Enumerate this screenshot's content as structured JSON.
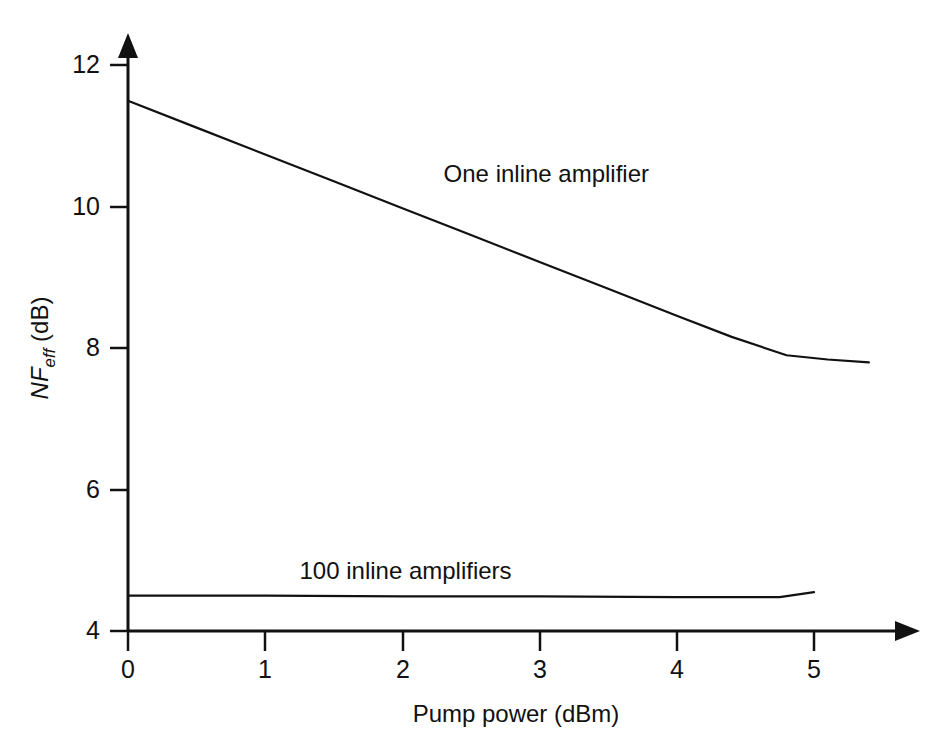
{
  "chart_data": {
    "type": "line",
    "title": "",
    "xlabel": "Pump power (dBm)",
    "ylabel_main": "NF",
    "ylabel_sub": "eff",
    "ylabel_unit": " (dB)",
    "ylabel_full": "NFeff (dB)",
    "xlim": [
      0,
      5.75
    ],
    "ylim": [
      4,
      12.35
    ],
    "grid": false,
    "legend_position": "inline-annotations",
    "xticks": [
      0,
      1,
      2,
      3,
      4,
      5
    ],
    "xtick_labels": [
      "0",
      "1",
      "2",
      "3",
      "4",
      "5"
    ],
    "yticks": [
      4,
      6,
      8,
      10,
      12
    ],
    "ytick_labels": [
      "4",
      "6",
      "8",
      "10",
      "12"
    ],
    "series": [
      {
        "name": "One inline amplifier",
        "label_x": 2.3,
        "label_y": 10.35,
        "x": [
          0.0,
          0.5,
          1.0,
          1.5,
          2.0,
          2.5,
          3.0,
          3.5,
          4.0,
          4.4,
          4.8,
          5.1,
          5.4
        ],
        "values": [
          11.5,
          11.12,
          10.74,
          10.36,
          9.98,
          9.6,
          9.22,
          8.84,
          8.46,
          8.16,
          7.9,
          7.84,
          7.8
        ]
      },
      {
        "name": "100 inline amplifiers",
        "label_x": 1.25,
        "label_y": 4.74,
        "x": [
          0.0,
          1.0,
          2.0,
          3.0,
          4.0,
          4.75,
          5.0
        ],
        "values": [
          4.5,
          4.5,
          4.49,
          4.49,
          4.48,
          4.48,
          4.55
        ]
      }
    ]
  },
  "axes": {
    "y_arrow_name": "y-axis-arrow",
    "x_arrow_name": "x-axis-arrow"
  }
}
